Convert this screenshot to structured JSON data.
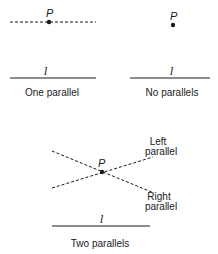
{
  "panels": [
    {
      "id": "euclidean",
      "caption": "One parallel",
      "point_label": "P",
      "line_label": "l"
    },
    {
      "id": "elliptic",
      "caption": "No parallels",
      "point_label": "P",
      "line_label": "l"
    },
    {
      "id": "hyperbolic",
      "caption": "Two parallels",
      "point_label": "P",
      "line_label": "l",
      "left_parallel_label": [
        "Left",
        "parallel"
      ],
      "right_parallel_label": [
        "Right",
        "parallel"
      ]
    }
  ],
  "colors": {
    "ink": "#1a1a1a",
    "background": "#ffffff"
  }
}
